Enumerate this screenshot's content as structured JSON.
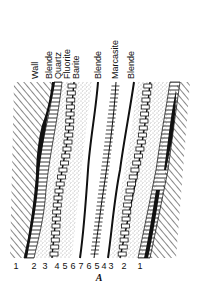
{
  "figure": {
    "caption": "A",
    "top_labels": [
      {
        "text": "Wall",
        "x": 38
      },
      {
        "text": "Blende",
        "x": 52
      },
      {
        "text": "Quartz",
        "x": 61
      },
      {
        "text": "Fluorite",
        "x": 70
      },
      {
        "text": "Barite",
        "x": 79
      },
      {
        "text": "Blende",
        "x": 101
      },
      {
        "text": "Marcasite",
        "x": 118
      },
      {
        "text": "Blende",
        "x": 134
      }
    ],
    "bottom_numbers": [
      {
        "text": "1",
        "x": 16
      },
      {
        "text": "2",
        "x": 34
      },
      {
        "text": "3",
        "x": 45
      },
      {
        "text": "4",
        "x": 57
      },
      {
        "text": "5",
        "x": 65
      },
      {
        "text": "6",
        "x": 73
      },
      {
        "text": "7",
        "x": 81
      },
      {
        "text": "6",
        "x": 89
      },
      {
        "text": "5",
        "x": 97
      },
      {
        "text": "4",
        "x": 104
      },
      {
        "text": "3",
        "x": 111
      },
      {
        "text": "2",
        "x": 124
      },
      {
        "text": "1",
        "x": 140
      }
    ],
    "layers": [
      {
        "index": 1,
        "name": "Wall",
        "pattern": "diagonal-hatch"
      },
      {
        "index": 2,
        "name": "Blende",
        "pattern": "solid-black-band"
      },
      {
        "index": 3,
        "name": "Quartz",
        "pattern": "horizontal-ladder"
      },
      {
        "index": 4,
        "name": "Fluorite",
        "pattern": "stipple"
      },
      {
        "index": 5,
        "name": "Barite",
        "pattern": "box-ladder"
      },
      {
        "index": 6,
        "name": "Blende",
        "pattern": "black-line"
      },
      {
        "index": 7,
        "name": "Marcasite",
        "pattern": "tick-ladder"
      }
    ],
    "colors": {
      "ink": "#111111",
      "paper": "#ffffff",
      "stipple": "#555555"
    }
  }
}
